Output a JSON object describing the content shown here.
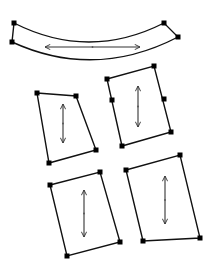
{
  "diagram": {
    "title": "",
    "colors": {
      "stroke": "#111111",
      "fill_default": "#ffffff",
      "fill_selected": "#d9d9d9",
      "arrow": "#333333"
    },
    "shapes": [
      {
        "id": "curved-strip",
        "type": "curved-band",
        "selected": false,
        "corners": [
          [
            14,
            23
          ],
          [
            164,
            23
          ],
          [
            178,
            37
          ],
          [
            12,
            42
          ]
        ],
        "arrow": {
          "orientation": "horizontal",
          "from": [
            45,
            47
          ],
          "to": [
            140,
            47
          ]
        }
      },
      {
        "id": "quad-top-left",
        "type": "quad",
        "selected": false,
        "corners": [
          [
            37,
            93
          ],
          [
            76,
            96
          ],
          [
            96,
            150
          ],
          [
            49,
            163
          ]
        ],
        "arrow": {
          "orientation": "vertical",
          "from": [
            63,
            104
          ],
          "to": [
            63,
            143
          ]
        }
      },
      {
        "id": "quad-top-right",
        "type": "quad",
        "selected": false,
        "corners": [
          [
            107,
            79
          ],
          [
            154,
            66
          ],
          [
            171,
            132
          ],
          [
            122,
            146
          ]
        ],
        "midpoint_handles": [
          [
            112,
            100
          ],
          [
            164,
            99
          ]
        ],
        "arrow": {
          "orientation": "vertical",
          "from": [
            138,
            86
          ],
          "to": [
            138,
            127
          ]
        }
      },
      {
        "id": "quad-bottom-left",
        "type": "quad",
        "selected": false,
        "corners": [
          [
            50,
            185
          ],
          [
            100,
            172
          ],
          [
            120,
            242
          ],
          [
            67,
            256
          ]
        ],
        "arrow": {
          "orientation": "vertical",
          "from": [
            84,
            190
          ],
          "to": [
            84,
            237
          ]
        }
      },
      {
        "id": "quad-bottom-right",
        "type": "quad",
        "selected": true,
        "corners": [
          [
            126,
            170
          ],
          [
            180,
            155
          ],
          [
            200,
            238
          ],
          [
            143,
            241
          ]
        ],
        "arrow": {
          "orientation": "vertical",
          "from": [
            165,
            176
          ],
          "to": [
            165,
            224
          ]
        }
      }
    ]
  }
}
